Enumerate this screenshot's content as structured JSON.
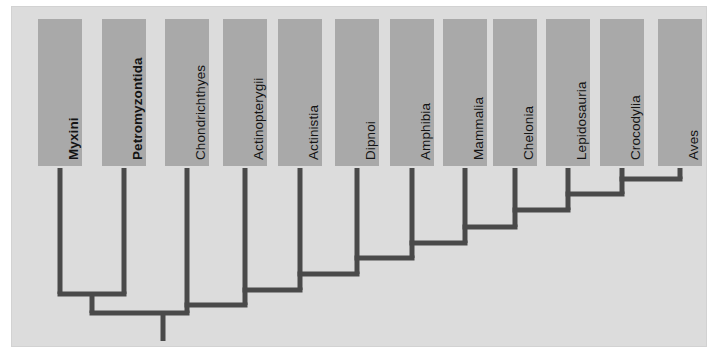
{
  "figure": {
    "kind": "cladogram",
    "orientation": "vertical-tips-top",
    "panel": {
      "background_color": "#dcdcdc",
      "border_color": "#d2d2d2"
    },
    "branch_color": "#4a4a4a",
    "label_box_color": "#a9a9a9",
    "label_text_color": "#141414"
  },
  "chart_data": {
    "type": "diagram",
    "title": "",
    "xlabel": "",
    "ylabel": "",
    "taxa": [
      {
        "label": "Myxini",
        "bold": true,
        "x": 60,
        "stem_top": 168,
        "node_y": 294
      },
      {
        "label": "Petromyzontida",
        "bold": true,
        "x": 124,
        "stem_top": 168,
        "node_y": 294
      },
      {
        "label": "Chondrichthyes",
        "bold": false,
        "x": 187,
        "stem_top": 168,
        "node_y": 305
      },
      {
        "label": "Actinopterygii",
        "bold": false,
        "x": 245,
        "stem_top": 168,
        "node_y": 290
      },
      {
        "label": "Actinistia",
        "bold": false,
        "x": 300,
        "stem_top": 168,
        "node_y": 274
      },
      {
        "label": "Dipnoi",
        "bold": false,
        "x": 357,
        "stem_top": 168,
        "node_y": 258
      },
      {
        "label": "Amphibia",
        "bold": false,
        "x": 412,
        "stem_top": 168,
        "node_y": 243
      },
      {
        "label": "Mammalia",
        "bold": false,
        "x": 465,
        "stem_top": 168,
        "node_y": 227
      },
      {
        "label": "Chelonia",
        "bold": false,
        "x": 515,
        "stem_top": 168,
        "node_y": 210
      },
      {
        "label": "Lepidosauria",
        "bold": false,
        "x": 568,
        "stem_top": 168,
        "node_y": 194
      },
      {
        "label": "Crocodylia",
        "bold": false,
        "x": 622,
        "stem_top": 168,
        "node_y": 179
      },
      {
        "label": "Aves",
        "bold": false,
        "x": 680,
        "stem_top": 168,
        "node_y": 179
      }
    ],
    "nodes": [
      {
        "name": "archosauria",
        "y": 179,
        "children": [
          "Crocodylia",
          "Aves"
        ]
      },
      {
        "name": "reptilia-lepido",
        "y": 194,
        "children": [
          "Lepidosauria",
          "archosauria"
        ]
      },
      {
        "name": "reptilia",
        "y": 210,
        "children": [
          "Chelonia",
          "reptilia-lepido"
        ]
      },
      {
        "name": "amniota",
        "y": 227,
        "children": [
          "Mammalia",
          "reptilia"
        ]
      },
      {
        "name": "tetrapoda",
        "y": 243,
        "children": [
          "Amphibia",
          "amniota"
        ]
      },
      {
        "name": "rhipidistia",
        "y": 258,
        "children": [
          "Dipnoi",
          "tetrapoda"
        ]
      },
      {
        "name": "sarcopterygii",
        "y": 274,
        "children": [
          "Actinistia",
          "rhipidistia"
        ]
      },
      {
        "name": "osteichthyes",
        "y": 290,
        "children": [
          "Actinopterygii",
          "sarcopterygii"
        ]
      },
      {
        "name": "gnathostomata",
        "y": 305,
        "children": [
          "Chondrichthyes",
          "osteichthyes"
        ]
      },
      {
        "name": "cyclostomata",
        "y": 294,
        "children": [
          "Myxini",
          "Petromyzontida"
        ]
      },
      {
        "name": "vertebrata-root",
        "y": 313,
        "children": [
          "cyclostomata",
          "gnathostomata"
        ]
      }
    ],
    "root_stem": {
      "x": 163,
      "y_top": 313,
      "y_bottom": 341
    }
  }
}
